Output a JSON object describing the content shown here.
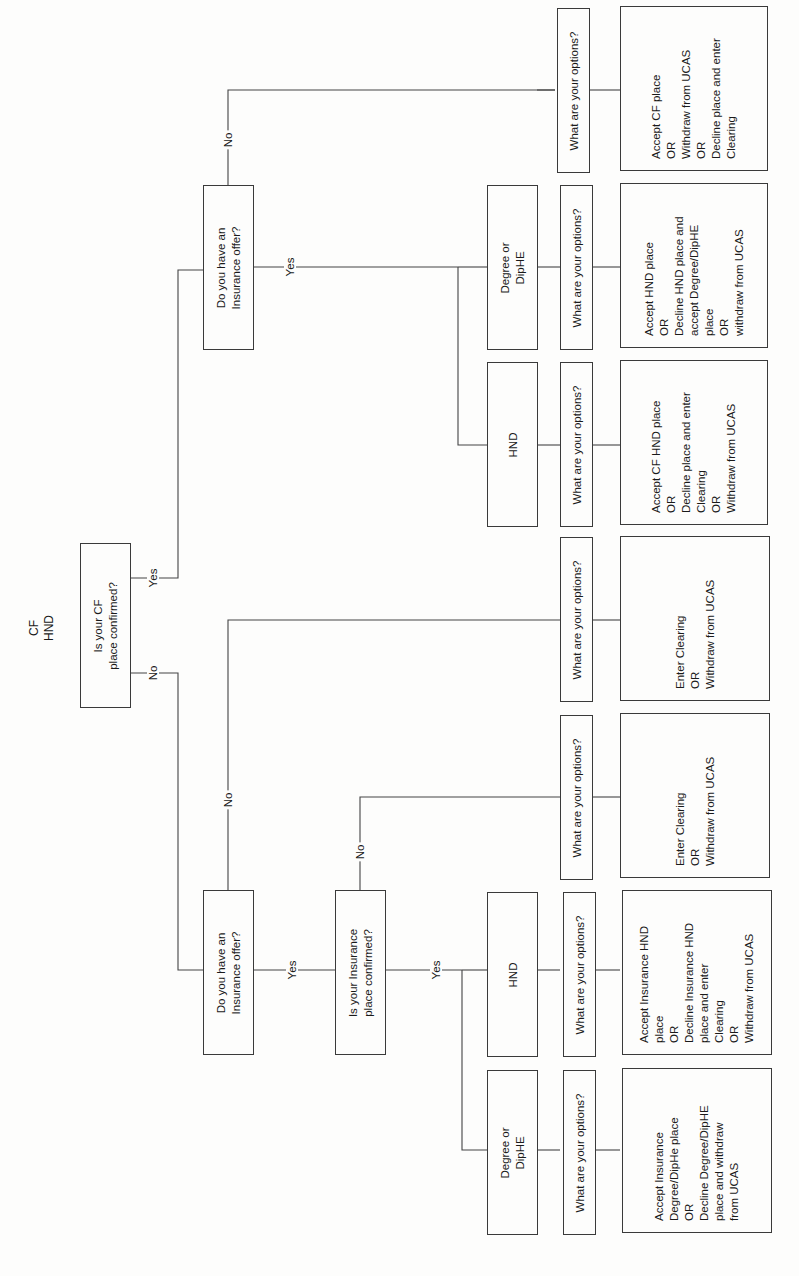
{
  "diagram": {
    "title": [
      "CF",
      "HND"
    ],
    "orientation": "rotated 90 degrees counter-clockwise",
    "nodes": {
      "cf_confirmed": {
        "lines": [
          "Is your CF",
          "place confirmed?"
        ]
      },
      "top_insurance_offer": {
        "lines": [
          "Do you have an",
          "Insurance offer?"
        ]
      },
      "top_hnd": {
        "lines": [
          "HND"
        ]
      },
      "top_degree": {
        "lines": [
          "Degree or",
          "DipHE"
        ]
      },
      "top_no_options_q": {
        "lines": [
          "What are your options?"
        ]
      },
      "top_hnd_options_q": {
        "lines": [
          "What are your options?"
        ]
      },
      "top_degree_options_q": {
        "lines": [
          "What are your options?"
        ]
      },
      "top_no_options": {
        "lines": [
          "Accept CF place",
          "OR",
          "Withdraw from UCAS",
          "OR",
          "Decline place and enter",
          "Clearing"
        ]
      },
      "top_degree_options": {
        "lines": [
          "Accept HND place",
          "OR",
          "Decline HND place and",
          "accept Degree/DipHE",
          "place",
          "OR",
          "withdraw from UCAS"
        ]
      },
      "top_hnd_options": {
        "lines": [
          "Accept CF HND place",
          "OR",
          "Decline place and enter",
          "Clearing",
          "OR",
          "Withdraw from UCAS"
        ]
      },
      "bottom_insurance_offer": {
        "lines": [
          "Do you have an",
          "Insurance offer?"
        ]
      },
      "bottom_no_offer_options_q": {
        "lines": [
          "What are your options?"
        ]
      },
      "bottom_no_offer_options": {
        "lines": [
          "Enter Clearing",
          "OR",
          "Withdraw from UCAS"
        ]
      },
      "insurance_confirmed": {
        "lines": [
          "Is your Insurance",
          "place confirmed?"
        ]
      },
      "ins_not_confirmed_options_q": {
        "lines": [
          "What are your options?"
        ]
      },
      "ins_not_confirmed_options": {
        "lines": [
          "Enter Clearing",
          "OR",
          "Withdraw from UCAS"
        ]
      },
      "bottom_hnd": {
        "lines": [
          "HND"
        ]
      },
      "bottom_degree": {
        "lines": [
          "Degree or",
          "DipHE"
        ]
      },
      "bottom_hnd_options_q": {
        "lines": [
          "What are your options?"
        ]
      },
      "bottom_degree_options_q": {
        "lines": [
          "What are your options?"
        ]
      },
      "bottom_hnd_options": {
        "lines": [
          "Accept Insurance HND",
          "place",
          "OR",
          "Decline Insurance HND",
          "place and enter",
          "Clearing",
          "OR",
          "Withdraw from UCAS"
        ]
      },
      "bottom_degree_options": {
        "lines": [
          "Accept Insurance",
          "Degree/DipHe place",
          "OR",
          "Decline Degree/DipHE",
          "place and withdraw",
          "from UCAS"
        ]
      }
    },
    "edge_labels": {
      "cf_yes": "Yes",
      "cf_no": "No",
      "top_ins_yes": "Yes",
      "top_ins_no": "No",
      "bottom_ins_yes": "Yes",
      "bottom_ins_no": "No",
      "ins_conf_yes": "Yes",
      "ins_conf_no": "No"
    }
  }
}
